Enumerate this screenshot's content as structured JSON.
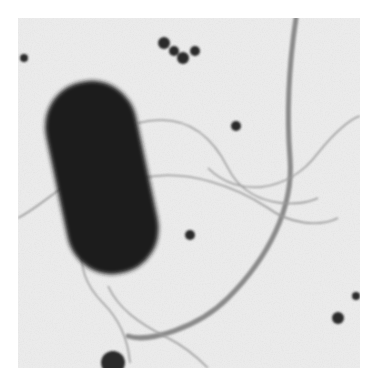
{
  "image": {
    "kind": "transmission electron micrograph (grayscale)",
    "subject": "rod-shaped bacterium with flagella",
    "frame": {
      "x": 18,
      "y": 18,
      "width": 342,
      "height": 350
    },
    "colors": {
      "page_background": "#ffffff",
      "field_background": "#ebebeb",
      "bacterium": "#1c1c1c",
      "fiber": "#8a8a8a",
      "flagella": "#9a9a9a",
      "particles": "#2a2a2a"
    }
  },
  "elements": [
    {
      "name": "bacterium-body",
      "shape": "rounded rod",
      "center": [
        90,
        175
      ],
      "length": 195,
      "width": 95,
      "tilt_deg": -12
    },
    {
      "name": "long-fiber",
      "shape": "curved beaded strand",
      "path": "top-right to bottom-center"
    },
    {
      "name": "flagella",
      "count": 4
    },
    {
      "name": "particle-cluster",
      "position": [
        185,
        55
      ]
    },
    {
      "name": "small-particles",
      "count": 6
    }
  ]
}
